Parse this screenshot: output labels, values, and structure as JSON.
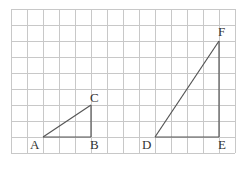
{
  "diagram": {
    "grid": {
      "x0": 11,
      "y0": 9,
      "cols": 14,
      "rows": 9,
      "cell": 16,
      "color": "#c8c8c8"
    },
    "line_color": "#555555",
    "triangles": [
      {
        "name": "ABC",
        "points": [
          "A",
          "B",
          "C"
        ]
      },
      {
        "name": "DEF",
        "points": [
          "D",
          "E",
          "F"
        ]
      }
    ],
    "points": {
      "A": {
        "col": 2,
        "row": 8,
        "label": "A",
        "lx": 30,
        "ly": 138
      },
      "B": {
        "col": 5,
        "row": 8,
        "label": "B",
        "lx": 90,
        "ly": 138
      },
      "C": {
        "col": 5,
        "row": 6,
        "label": "C",
        "lx": 90,
        "ly": 91
      },
      "D": {
        "col": 9,
        "row": 8,
        "label": "D",
        "lx": 142,
        "ly": 138
      },
      "E": {
        "col": 13,
        "row": 8,
        "label": "E",
        "lx": 218,
        "ly": 138
      },
      "F": {
        "col": 13,
        "row": 2,
        "label": "F",
        "lx": 218,
        "ly": 25
      }
    }
  }
}
